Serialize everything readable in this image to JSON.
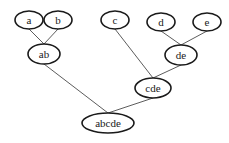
{
  "diagram": {
    "type": "tree",
    "nodes": [
      {
        "id": "a",
        "label": "a",
        "cx": 29,
        "cy": 20,
        "rx": 14,
        "ry": 9
      },
      {
        "id": "b",
        "label": "b",
        "cx": 58,
        "cy": 20,
        "rx": 14,
        "ry": 9
      },
      {
        "id": "c",
        "label": "c",
        "cx": 115,
        "cy": 20,
        "rx": 14,
        "ry": 9
      },
      {
        "id": "d",
        "label": "d",
        "cx": 161,
        "cy": 22,
        "rx": 14,
        "ry": 9
      },
      {
        "id": "e",
        "label": "e",
        "cx": 207,
        "cy": 22,
        "rx": 14,
        "ry": 9
      },
      {
        "id": "ab",
        "label": "ab",
        "cx": 44,
        "cy": 54,
        "rx": 16,
        "ry": 10
      },
      {
        "id": "de",
        "label": "de",
        "cx": 181,
        "cy": 55,
        "rx": 16,
        "ry": 10
      },
      {
        "id": "cde",
        "label": "cde",
        "cx": 153,
        "cy": 88,
        "rx": 18,
        "ry": 10
      },
      {
        "id": "abcde",
        "label": "abcde",
        "cx": 108,
        "cy": 123,
        "rx": 26,
        "ry": 10
      }
    ],
    "edges": [
      {
        "from": "a",
        "to": "ab"
      },
      {
        "from": "b",
        "to": "ab"
      },
      {
        "from": "d",
        "to": "de"
      },
      {
        "from": "e",
        "to": "de"
      },
      {
        "from": "c",
        "to": "cde"
      },
      {
        "from": "de",
        "to": "cde"
      },
      {
        "from": "ab",
        "to": "abcde"
      },
      {
        "from": "cde",
        "to": "abcde"
      }
    ]
  }
}
